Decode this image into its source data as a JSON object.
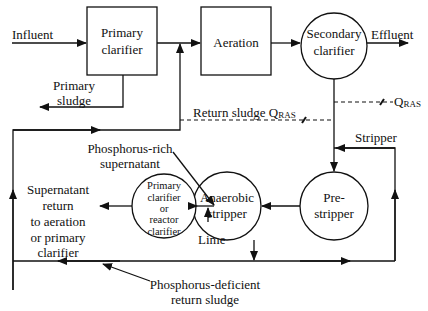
{
  "diagram": {
    "nodes": {
      "primary_clarifier": {
        "shape": "rect",
        "line1": "Primary",
        "line2": "clarifier"
      },
      "aeration": {
        "shape": "rect",
        "label": "Aeration"
      },
      "secondary_clarifier": {
        "shape": "circle",
        "line1": "Secondary",
        "line2": "clarifier"
      },
      "pre_stripper": {
        "shape": "circle",
        "line1": "Pre-",
        "line2": "stripper"
      },
      "anaerobic_stripper": {
        "shape": "circle",
        "line1": "Anaerobic",
        "line2": "stripper"
      },
      "reactor_clarifier": {
        "shape": "circle",
        "line1": "Primary",
        "line2": "clarifier",
        "line3": "or",
        "line4": "reactor",
        "line5": "clarifier"
      }
    },
    "labels": {
      "influent": "Influent",
      "effluent": "Effluent",
      "primary_sludge_1": "Primary",
      "primary_sludge_2": "sludge",
      "return_sludge": "Return sludge Q",
      "return_sludge_sub": "RAS",
      "qras": "Q",
      "qras_sub": "RAS",
      "stripper": "Stripper",
      "p_rich_1": "Phosphorus-rich",
      "p_rich_2": "supernatant",
      "supernatant_1": "Supernatant",
      "supernatant_2": "return",
      "supernatant_3": "to aeration",
      "supernatant_4": "or primary",
      "supernatant_5": "clarifier",
      "lime": "Lime",
      "p_deficient_1": "Phosphorus-deficient",
      "p_deficient_2": "return sludge"
    },
    "edges": [
      {
        "from": "influent",
        "to": "primary_clarifier"
      },
      {
        "from": "primary_clarifier",
        "to": "aeration"
      },
      {
        "from": "aeration",
        "to": "secondary_clarifier"
      },
      {
        "from": "secondary_clarifier",
        "to": "effluent"
      },
      {
        "from": "primary_clarifier",
        "to": "primary_sludge"
      },
      {
        "from": "secondary_clarifier",
        "to": "aeration",
        "label": "Return sludge QRAS",
        "style": "dashed"
      },
      {
        "from": "secondary_clarifier",
        "to": "pre_stripper"
      },
      {
        "from": "pre_stripper",
        "to": "anaerobic_stripper"
      },
      {
        "from": "anaerobic_stripper",
        "to": "reactor_clarifier",
        "label": "Phosphorus-rich supernatant"
      },
      {
        "from": "lime",
        "to": "reactor_clarifier"
      },
      {
        "from": "reactor_clarifier",
        "to": "supernatant_return"
      },
      {
        "from": "anaerobic_stripper",
        "to": "return_line",
        "label": "Phosphorus-deficient return sludge"
      },
      {
        "from": "return_line",
        "to": "pre_stripper",
        "label": "Stripper"
      },
      {
        "from": "return_line",
        "to": "aeration"
      }
    ]
  }
}
